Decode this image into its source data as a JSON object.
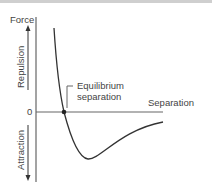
{
  "diagram": {
    "y_axis_label": "Force",
    "x_axis_label": "Separation",
    "origin_label": "0",
    "upper_region_label": "Repulsion",
    "lower_region_label": "Attraction",
    "annotation": {
      "line1": "Equilibrium",
      "line2": "separation"
    },
    "colors": {
      "axis": "#666666",
      "curve": "#333333",
      "text": "#444444",
      "marker": "#222222"
    }
  }
}
